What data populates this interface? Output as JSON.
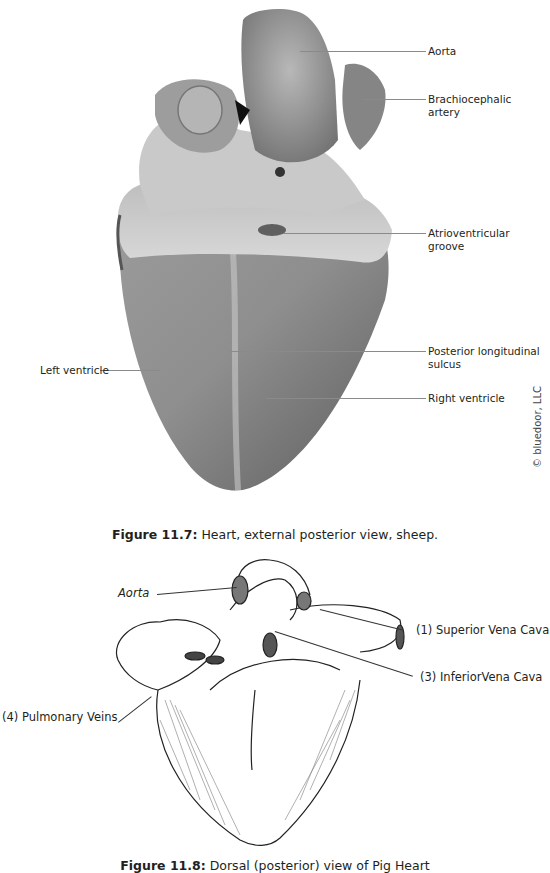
{
  "figure_photo": {
    "labels": {
      "aorta": "Aorta",
      "brachiocephalic_artery": "Brachiocephalic artery",
      "atrioventricular_groove": "Atrioventricular groove",
      "posterior_longitudinal_sulcus": "Posterior longitudinal sulcus",
      "right_ventricle": "Right ventricle",
      "left_ventricle": "Left ventricle"
    },
    "copyright": "© bluedoor, LLC",
    "caption_number": "Figure 11.7:",
    "caption_text": " Heart, external posterior view, sheep."
  },
  "figure_drawing": {
    "labels": {
      "aorta": "Aorta",
      "superior_vena_cava": "(1) Superior Vena Cava",
      "inferior_vena_cava": "(3) InferiorVena Cava",
      "pulmonary_veins": "(4) Pulmonary Veins"
    },
    "caption_number": "Figure 11.8:",
    "caption_text": " Dorsal (posterior) view of Pig Heart"
  },
  "colors": {
    "text": "#231f20",
    "leader_photo": "#8a8a8a",
    "leader_drawing": "#333333"
  }
}
